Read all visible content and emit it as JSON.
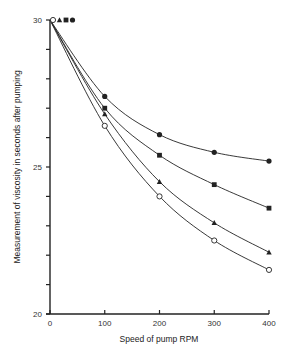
{
  "chart_data": {
    "type": "line",
    "title": "",
    "xlabel": "Speed of pump RPM",
    "ylabel": "Measurement of viscosity in seconds after pumping",
    "x": [
      0,
      100,
      200,
      300,
      400
    ],
    "xlim": [
      0,
      400
    ],
    "ylim": [
      20,
      30
    ],
    "x_ticks": [
      0,
      100,
      200,
      300,
      400
    ],
    "y_tick_labels": [
      20,
      25,
      30
    ],
    "y_minor_step": 1,
    "grid": false,
    "legend": "none (marker-only key at top: open circle, triangle, square, filled circle)",
    "series": [
      {
        "name": "filled-circle",
        "marker": "filled-circle",
        "values": [
          30,
          27.4,
          26.1,
          25.5,
          25.2
        ]
      },
      {
        "name": "filled-square",
        "marker": "filled-square",
        "values": [
          30,
          27.0,
          25.4,
          24.4,
          23.6
        ]
      },
      {
        "name": "filled-triangle",
        "marker": "filled-triangle",
        "values": [
          30,
          26.8,
          24.5,
          23.1,
          22.1
        ]
      },
      {
        "name": "open-circle",
        "marker": "open-circle",
        "values": [
          30,
          26.4,
          24.0,
          22.5,
          21.5
        ]
      }
    ],
    "key_markers_at_top": [
      "open-circle",
      "filled-triangle",
      "filled-square",
      "filled-circle"
    ]
  },
  "axes": {
    "x_title": "Speed of pump RPM",
    "y_title": "Measurement of viscosity in seconds after pumping"
  },
  "colors": {
    "ink": "#222222",
    "background": "#ffffff"
  }
}
